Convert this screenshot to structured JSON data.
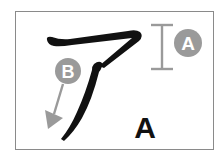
{
  "diagram": {
    "character": "ア",
    "character_label": "A",
    "annotations": [
      {
        "id": "A",
        "label": "A",
        "meaning": "height-marker"
      },
      {
        "id": "B",
        "label": "B",
        "meaning": "stroke-direction-arrow"
      }
    ],
    "colors": {
      "stroke": "#111111",
      "annotation": "#9a9a9a",
      "frame": "#8a8a8a",
      "badge_text": "#ffffff"
    }
  }
}
